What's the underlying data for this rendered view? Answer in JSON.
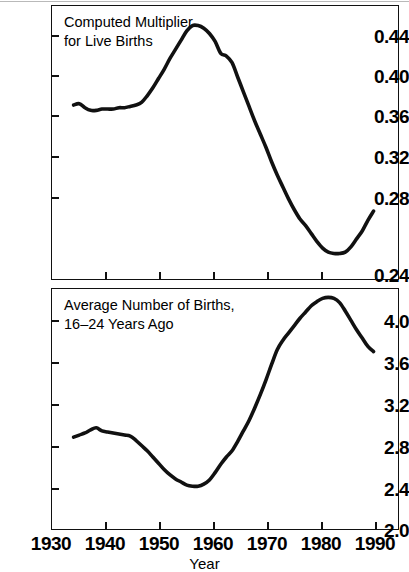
{
  "figure": {
    "width": 409,
    "height": 572,
    "background": "#ffffff",
    "line_color": "#111111",
    "axis_color": "#111111"
  },
  "shared": {
    "xlabel": "Year",
    "x_ticks": [
      1930,
      1940,
      1950,
      1960,
      1970,
      1980,
      1990
    ],
    "x_tick_labels": [
      "1930",
      "1940",
      "1950",
      "1960",
      "1970",
      "1980",
      "1990"
    ],
    "xlim": [
      1930,
      1991.5
    ]
  },
  "panels": [
    {
      "id": "top",
      "caption": "Computed Multiplier\nfor Live Births",
      "y_tick_labels": [
        "0.44",
        "0.40",
        "0.36",
        "0.32",
        "0.28",
        "0.24"
      ]
    },
    {
      "id": "bottom",
      "caption": "Average Number of Births,\n16–24 Years Ago",
      "y_tick_labels": [
        "4.0",
        "3.6",
        "3.2",
        "2.8",
        "2.4",
        "2.0"
      ]
    }
  ],
  "chart_data": [
    {
      "type": "line",
      "id": "computed-multiplier-for-live-births",
      "title": "Computed Multiplier for Live Births",
      "xlabel": "Year",
      "ylabel": "Computed Multiplier for Live Births",
      "xlim": [
        1930,
        1991.5
      ],
      "ylim": [
        0.24,
        0.4475
      ],
      "y_ticks": [
        0.24,
        0.28,
        0.32,
        0.36,
        0.4,
        0.44
      ],
      "x_ticks": [
        1930,
        1940,
        1950,
        1960,
        1970,
        1980,
        1990
      ],
      "grid": false,
      "legend": "none",
      "series": [
        {
          "name": "Computed Multiplier for Live Births",
          "color": "#111111",
          "x": [
            1934,
            1935,
            1936,
            1937,
            1938,
            1939,
            1940,
            1941,
            1942,
            1943,
            1944,
            1945,
            1946,
            1947,
            1948,
            1949,
            1950,
            1951,
            1952,
            1953,
            1954,
            1955,
            1956,
            1957,
            1958,
            1959,
            1960,
            1961,
            1962,
            1963,
            1964,
            1965,
            1966,
            1967,
            1968,
            1969,
            1970,
            1971,
            1972,
            1973,
            1974,
            1975,
            1976,
            1977,
            1978,
            1979,
            1980,
            1981,
            1982,
            1983,
            1984,
            1985,
            1986,
            1987
          ],
          "y": [
            0.372,
            0.373,
            0.37,
            0.368,
            0.368,
            0.369,
            0.369,
            0.369,
            0.37,
            0.37,
            0.371,
            0.372,
            0.374,
            0.379,
            0.385,
            0.392,
            0.399,
            0.407,
            0.414,
            0.421,
            0.428,
            0.432,
            0.432,
            0.43,
            0.426,
            0.42,
            0.411,
            0.409,
            0.404,
            0.393,
            0.382,
            0.371,
            0.36,
            0.35,
            0.34,
            0.329,
            0.319,
            0.31,
            0.301,
            0.293,
            0.286,
            0.281,
            0.275,
            0.269,
            0.264,
            0.261,
            0.26,
            0.26,
            0.261,
            0.265,
            0.271,
            0.277,
            0.285,
            0.292
          ]
        }
      ]
    },
    {
      "type": "line",
      "id": "average-number-of-births-16-24-years-ago",
      "title": "Average Number of Births, 16–24 Years Ago",
      "xlabel": "Year",
      "ylabel": "Average Number of Births, 16–24 Years Ago",
      "xlim": [
        1930,
        1991.5
      ],
      "ylim": [
        2.0,
        4.32
      ],
      "y_ticks": [
        2.0,
        2.4,
        2.8,
        3.2,
        3.6,
        4.0
      ],
      "x_ticks": [
        1930,
        1940,
        1950,
        1960,
        1970,
        1980,
        1990
      ],
      "grid": false,
      "legend": "none",
      "series": [
        {
          "name": "Average Number of Births, 16–24 Years Ago",
          "color": "#111111",
          "x": [
            1934,
            1935,
            1936,
            1937,
            1938,
            1939,
            1940,
            1941,
            1942,
            1943,
            1944,
            1945,
            1946,
            1947,
            1948,
            1949,
            1950,
            1951,
            1952,
            1953,
            1954,
            1955,
            1956,
            1957,
            1958,
            1959,
            1960,
            1961,
            1962,
            1963,
            1964,
            1965,
            1966,
            1967,
            1968,
            1969,
            1970,
            1971,
            1972,
            1973,
            1974,
            1975,
            1976,
            1977,
            1978,
            1979,
            1980,
            1981,
            1982,
            1983,
            1984,
            1985,
            1986,
            1987
          ],
          "y": [
            2.89,
            2.91,
            2.93,
            2.96,
            2.98,
            2.95,
            2.94,
            2.93,
            2.92,
            2.91,
            2.9,
            2.86,
            2.81,
            2.76,
            2.7,
            2.64,
            2.58,
            2.53,
            2.49,
            2.46,
            2.43,
            2.42,
            2.42,
            2.44,
            2.48,
            2.55,
            2.63,
            2.7,
            2.76,
            2.85,
            2.95,
            3.05,
            3.17,
            3.3,
            3.44,
            3.59,
            3.73,
            3.82,
            3.89,
            3.96,
            4.03,
            4.09,
            4.15,
            4.19,
            4.22,
            4.23,
            4.22,
            4.18,
            4.1,
            4.01,
            3.92,
            3.84,
            3.76,
            3.71
          ]
        }
      ]
    }
  ]
}
